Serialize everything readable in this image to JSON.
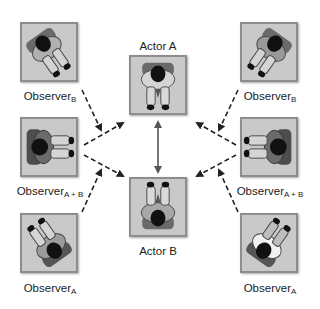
{
  "diagram": {
    "actors": [
      {
        "id": "actor-a",
        "label": "Actor A",
        "facing": "down"
      },
      {
        "id": "actor-b",
        "label": "Actor B",
        "facing": "up"
      }
    ],
    "observers": {
      "left": [
        {
          "id": "obs-left-b",
          "base": "Observer",
          "sub": "B"
        },
        {
          "id": "obs-left-ab",
          "base": "Observer",
          "sub": "A + B"
        },
        {
          "id": "obs-left-a",
          "base": "Observer",
          "sub": "A"
        }
      ],
      "right": [
        {
          "id": "obs-right-b",
          "base": "Observer",
          "sub": "B"
        },
        {
          "id": "obs-right-ab",
          "base": "Observer",
          "sub": "A + B"
        },
        {
          "id": "obs-right-a",
          "base": "Observer",
          "sub": "A"
        }
      ]
    },
    "connections": [
      {
        "from": "actor-a",
        "to": "actor-b",
        "style": "solid",
        "bidirectional": true
      },
      {
        "from": "obs-left-b",
        "to": "convergence-left",
        "style": "dashed"
      },
      {
        "from": "obs-left-ab",
        "to": "actor-a",
        "style": "dashed"
      },
      {
        "from": "obs-left-ab",
        "to": "actor-b",
        "style": "dashed"
      },
      {
        "from": "obs-left-a",
        "to": "convergence-left",
        "style": "dashed"
      },
      {
        "from": "obs-right-b",
        "to": "convergence-right",
        "style": "dashed"
      },
      {
        "from": "obs-right-ab",
        "to": "actor-a",
        "style": "dashed"
      },
      {
        "from": "obs-right-ab",
        "to": "actor-b",
        "style": "dashed"
      },
      {
        "from": "obs-right-a",
        "to": "convergence-right",
        "style": "dashed"
      }
    ],
    "colors": {
      "box_fill": "#c9c9c9",
      "box_border": "#8d8d8d",
      "arrow": "#222222",
      "actor_arrow": "#555555"
    }
  }
}
